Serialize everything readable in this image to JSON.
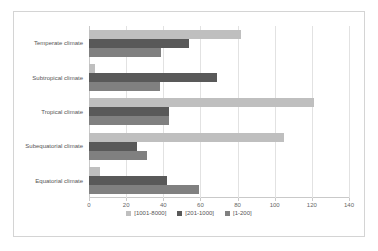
{
  "chart_data": {
    "type": "bar",
    "orientation": "horizontal",
    "title": "",
    "xlabel": "",
    "ylabel": "",
    "xlim": [
      0,
      140
    ],
    "xticks": [
      0,
      20,
      40,
      60,
      80,
      100,
      120,
      140
    ],
    "grid": true,
    "legend_position": "bottom",
    "categories": [
      "Temperate climate",
      "Subtropical climate",
      "Tropical climate",
      "Subequatorial climate",
      "Equatorial climate"
    ],
    "series": [
      {
        "name": "[1001-8000]",
        "color": "#bfbfbf",
        "values": [
          82,
          3,
          121,
          105,
          6
        ]
      },
      {
        "name": "[201-1000]",
        "color": "#595959",
        "values": [
          54,
          69,
          43,
          26,
          42
        ]
      },
      {
        "name": "[1-200]",
        "color": "#808080",
        "values": [
          39,
          38,
          43,
          31,
          59
        ]
      }
    ]
  }
}
